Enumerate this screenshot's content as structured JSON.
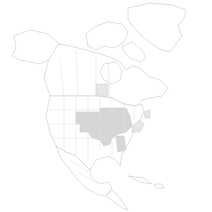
{
  "map": {
    "region": "North America",
    "background_color": "#ffffff",
    "land_fill": "#ffffff",
    "outline_color": "#c9c9c9",
    "highlight_color": "#d6d6d6",
    "highlight_light_color": "#e6e6e6",
    "highlighted_regions": [
      "Central United States (Great Plains / Midwest)",
      "Southern Manitoba / Saskatchewan",
      "Ohio Valley region",
      "Mississippi / Alabama area"
    ]
  }
}
